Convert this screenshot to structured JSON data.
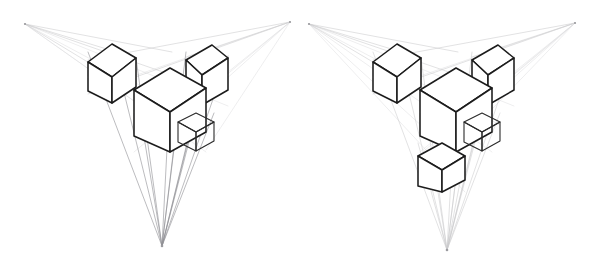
{
  "illustration": {
    "title": "Three-point perspective cube studies",
    "background_color": "#ffffff",
    "edge_color": "#1c1c1c",
    "guide_color": "#c9c9cc",
    "panel_count": 2
  },
  "panels": [
    {
      "id": "panel-left",
      "name": "three-point-perspective-diagram-left",
      "origin": {
        "x": 0,
        "y": 0
      },
      "size": {
        "width": 303,
        "height": 260
      },
      "vanishing_points": [
        {
          "name": "vanishing-point-left",
          "label": "VP-L",
          "x": 25,
          "y": 24
        },
        {
          "name": "vanishing-point-right",
          "label": "VP-R",
          "x": 290,
          "y": 22
        },
        {
          "name": "vanishing-point-bottom",
          "label": "VP-B",
          "x": 162,
          "y": 246
        }
      ],
      "cubes": [
        {
          "name": "cube-center-large",
          "size": "large",
          "position": "center",
          "x": 134,
          "y": 76,
          "w": 72,
          "h": 76
        },
        {
          "name": "cube-upper-left",
          "size": "medium",
          "position": "upper-left",
          "x": 88,
          "y": 52,
          "w": 48,
          "h": 52
        },
        {
          "name": "cube-upper-right",
          "size": "medium",
          "position": "upper-right",
          "x": 186,
          "y": 52,
          "w": 42,
          "h": 54
        },
        {
          "name": "cube-lower-right",
          "size": "small",
          "position": "lower-right",
          "x": 178,
          "y": 113,
          "w": 36,
          "h": 38
        }
      ],
      "cube_count": 4
    },
    {
      "id": "panel-right",
      "name": "three-point-perspective-diagram-right",
      "origin": {
        "x": 302,
        "y": 0
      },
      "size": {
        "width": 303,
        "height": 260
      },
      "vanishing_points": [
        {
          "name": "vanishing-point-left",
          "label": "VP-L",
          "x": 7,
          "y": 24
        },
        {
          "name": "vanishing-point-right",
          "label": "VP-R",
          "x": 273,
          "y": 23
        },
        {
          "name": "vanishing-point-bottom",
          "label": "VP-B",
          "x": 145,
          "y": 250
        }
      ],
      "cubes": [
        {
          "name": "cube-center-large",
          "size": "large",
          "position": "center",
          "x": 118,
          "y": 76,
          "w": 72,
          "h": 76
        },
        {
          "name": "cube-upper-left",
          "size": "medium",
          "position": "upper-left",
          "x": 71,
          "y": 52,
          "w": 48,
          "h": 52
        },
        {
          "name": "cube-upper-right",
          "size": "medium",
          "position": "upper-right",
          "x": 170,
          "y": 52,
          "w": 42,
          "h": 54
        },
        {
          "name": "cube-mid-right",
          "size": "small",
          "position": "mid-right",
          "x": 162,
          "y": 113,
          "w": 36,
          "h": 38
        },
        {
          "name": "cube-bottom",
          "size": "medium",
          "position": "bottom",
          "x": 116,
          "y": 143,
          "w": 47,
          "h": 49
        }
      ],
      "cube_count": 5
    }
  ]
}
